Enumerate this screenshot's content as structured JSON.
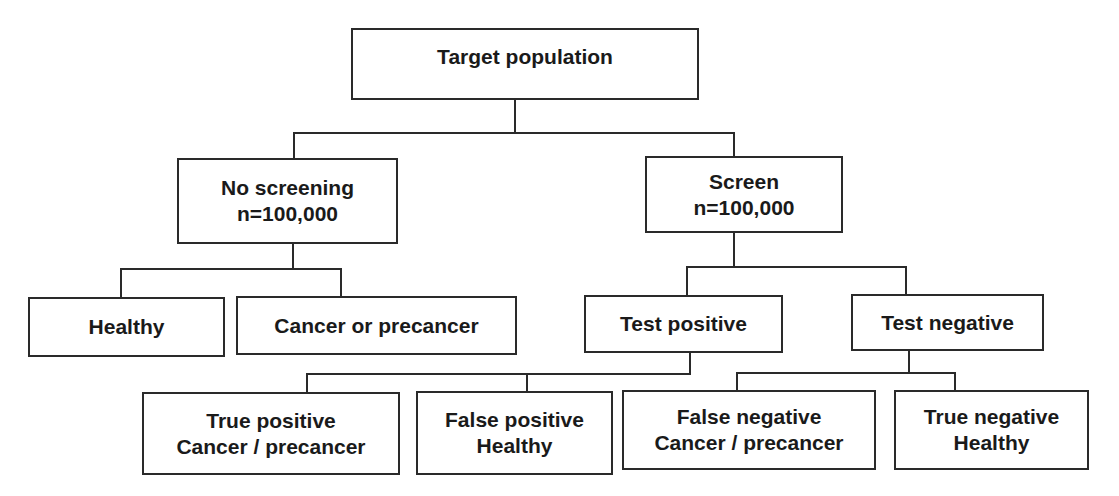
{
  "diagram": {
    "type": "flowchart-tree",
    "root": {
      "label": "Target population"
    },
    "arms": [
      {
        "id": "no-screening",
        "label": "No screening",
        "n": "n=100,000",
        "children": [
          {
            "id": "healthy",
            "line1": "Healthy"
          },
          {
            "id": "cancer-or-precancer",
            "line1": "Cancer or precancer"
          }
        ]
      },
      {
        "id": "screen",
        "label": "Screen",
        "n": "n=100,000",
        "children": [
          {
            "id": "test-positive",
            "line1": "Test positive",
            "children": [
              {
                "id": "true-positive",
                "line1": "True positive",
                "line2": "Cancer / precancer"
              },
              {
                "id": "false-positive",
                "line1": "False positive",
                "line2": "Healthy"
              }
            ]
          },
          {
            "id": "test-negative",
            "line1": "Test negative",
            "children": [
              {
                "id": "false-negative",
                "line1": "False negative",
                "line2": "Cancer / precancer"
              },
              {
                "id": "true-negative",
                "line1": "True negative",
                "line2": "Healthy"
              }
            ]
          }
        ]
      }
    ]
  }
}
